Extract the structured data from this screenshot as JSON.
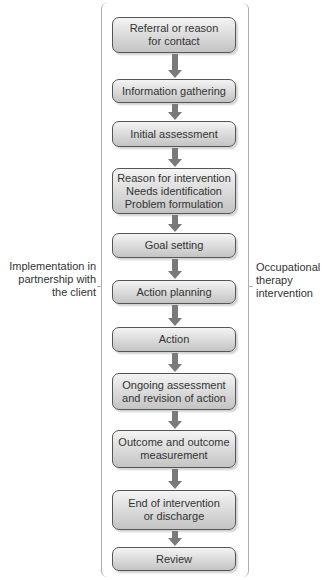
{
  "diagram": {
    "type": "flowchart",
    "steps": [
      {
        "label": "Referral or reason\nfor contact",
        "top": 17,
        "height": 36
      },
      {
        "label": "Information gathering",
        "top": 79,
        "height": 24
      },
      {
        "label": "Initial assessment",
        "top": 121,
        "height": 26
      },
      {
        "label": "Reason for intervention\nNeeds identification\nProblem formulation",
        "top": 168,
        "height": 46
      },
      {
        "label": "Goal setting",
        "top": 233,
        "height": 25
      },
      {
        "label": "Action planning",
        "top": 280,
        "height": 24
      },
      {
        "label": "Action",
        "top": 327,
        "height": 25
      },
      {
        "label": "Ongoing assessment\nand revision of action",
        "top": 373,
        "height": 37
      },
      {
        "label": "Outcome and outcome\nmeasurement",
        "top": 430,
        "height": 38
      },
      {
        "label": "End of intervention\nor discharge",
        "top": 490,
        "height": 40
      },
      {
        "label": "Review",
        "top": 547,
        "height": 24
      }
    ],
    "left_bracket_label": "Implementation in\npartnership with\nthe client",
    "right_bracket_label": "Occupational\ntherapy\nintervention",
    "colors": {
      "box_border": "#555555",
      "box_fill_top": "#f4f4f4",
      "box_fill_bottom": "#c4c4c4",
      "arrow": "#7a7a7a",
      "bracket": "#b0b0b0"
    }
  }
}
